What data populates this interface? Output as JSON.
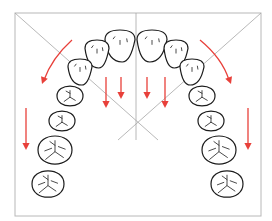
{
  "diagram": {
    "title": "",
    "colors": {
      "frame": "#b8b8b8",
      "guide": "#a6a6a6",
      "tooth_outline": "#1c1c1c",
      "arrow": "#e8403a"
    },
    "frame": {
      "x": 15,
      "y": 13,
      "w": 246,
      "h": 203
    },
    "guides": {
      "diagonal_left": {
        "x1": 15,
        "y1": 13,
        "x2": 158,
        "y2": 140
      },
      "diagonal_right": {
        "x1": 261,
        "y1": 13,
        "x2": 118,
        "y2": 140
      },
      "midline": {
        "x1": 136,
        "y1": 13,
        "x2": 136,
        "y2": 140
      }
    },
    "teeth": [
      {
        "name": "left-central-incisor",
        "cx": 120,
        "cy": 46,
        "rx": 15,
        "ry": 16,
        "type": "incisor"
      },
      {
        "name": "left-lateral-incisor",
        "cx": 97,
        "cy": 54,
        "rx": 12,
        "ry": 14,
        "type": "incisor"
      },
      {
        "name": "left-canine",
        "cx": 80,
        "cy": 72,
        "rx": 12,
        "ry": 13,
        "type": "canine"
      },
      {
        "name": "left-first-premolar",
        "cx": 70,
        "cy": 96,
        "rx": 13,
        "ry": 12,
        "type": "premolar"
      },
      {
        "name": "left-second-premolar",
        "cx": 62,
        "cy": 121,
        "rx": 13,
        "ry": 12,
        "type": "premolar"
      },
      {
        "name": "left-first-molar",
        "cx": 55,
        "cy": 150,
        "rx": 17,
        "ry": 17,
        "type": "molar"
      },
      {
        "name": "left-second-molar",
        "cx": 48,
        "cy": 184,
        "rx": 16,
        "ry": 16,
        "type": "molar"
      },
      {
        "name": "right-central-incisor",
        "cx": 152,
        "cy": 46,
        "rx": 15,
        "ry": 16,
        "type": "incisor"
      },
      {
        "name": "right-lateral-incisor",
        "cx": 176,
        "cy": 54,
        "rx": 12,
        "ry": 14,
        "type": "incisor"
      },
      {
        "name": "right-canine",
        "cx": 192,
        "cy": 72,
        "rx": 12,
        "ry": 13,
        "type": "canine"
      },
      {
        "name": "right-first-premolar",
        "cx": 202,
        "cy": 96,
        "rx": 13,
        "ry": 12,
        "type": "premolar"
      },
      {
        "name": "right-second-premolar",
        "cx": 211,
        "cy": 121,
        "rx": 13,
        "ry": 12,
        "type": "premolar"
      },
      {
        "name": "right-first-molar",
        "cx": 219,
        "cy": 150,
        "rx": 17,
        "ry": 17,
        "type": "molar"
      },
      {
        "name": "right-second-molar",
        "cx": 227,
        "cy": 184,
        "rx": 16,
        "ry": 16,
        "type": "molar"
      }
    ],
    "arrows": [
      {
        "name": "left-curved-arrow",
        "path": "M 72 40 Q 52 58 44 80",
        "tip": [
          42,
          84
        ],
        "angle": 110
      },
      {
        "name": "right-curved-arrow",
        "path": "M 200 40 Q 222 58 229 80",
        "tip": [
          231,
          84
        ],
        "angle": 70
      },
      {
        "name": "left-vertical-arrow",
        "path": "M 26 108 L 26 146",
        "tip": [
          26,
          150
        ],
        "angle": 90
      },
      {
        "name": "right-vertical-arrow",
        "path": "M 248 108 L 248 146",
        "tip": [
          248,
          150
        ],
        "angle": 90
      },
      {
        "name": "incisor-arrow-1",
        "path": "M 106 77 L 106 104",
        "tip": [
          106,
          108
        ],
        "angle": 90
      },
      {
        "name": "incisor-arrow-2",
        "path": "M 121 77 L 121 95",
        "tip": [
          121,
          99
        ],
        "angle": 90
      },
      {
        "name": "incisor-arrow-3",
        "path": "M 147 77 L 147 95",
        "tip": [
          147,
          99
        ],
        "angle": 90
      },
      {
        "name": "incisor-arrow-4",
        "path": "M 165 77 L 165 104",
        "tip": [
          165,
          108
        ],
        "angle": 90
      }
    ]
  }
}
